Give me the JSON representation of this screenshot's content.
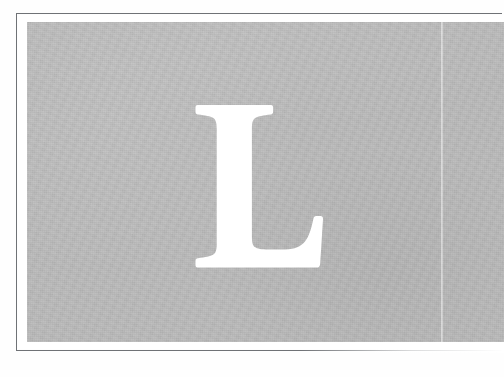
{
  "page": {
    "kind": "scanned-book-page",
    "media": "printed-page-photograph",
    "background_color": "#fefefe"
  },
  "plate": {
    "name": "grey-plate",
    "panel_color": "#b9b9b9",
    "rule_color": "#6f7276",
    "margin_color": "#ffffff",
    "has_rule": true,
    "rule_fades_right": true,
    "bleeds_right_edge": true
  },
  "gutter": {
    "name": "page-gutter-line",
    "visible": true,
    "color": "#d3d3d3"
  },
  "dropcap": {
    "character": "L",
    "color": "#ffffff",
    "style": "serif-roman-capital",
    "role": "initial-drop-capital"
  },
  "texture": {
    "grain": "paper-grain",
    "tone": "uneven-scan-tone"
  }
}
